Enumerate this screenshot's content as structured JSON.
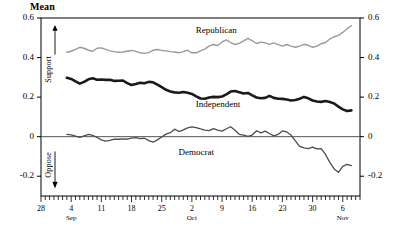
{
  "chart_data": {
    "type": "line",
    "title": "Mean",
    "xlabel": "",
    "ylabel": "Mean",
    "ylim": [
      -0.3,
      0.6
    ],
    "xlim": [
      0,
      74
    ],
    "grid": false,
    "legend_position": "inline-annotations",
    "y_ticks": [
      0.6,
      0.4,
      0.2,
      0,
      -0.2
    ],
    "y_tick_labels": [
      "0.6",
      "0.4",
      "0.2",
      "0",
      "-0.2"
    ],
    "y_tick_labels_right": [
      "0.6",
      "0.4",
      "0.2",
      "0",
      "-0.2"
    ],
    "x_ticks": [
      0,
      7,
      14,
      21,
      28,
      35,
      42,
      49,
      56,
      63,
      70
    ],
    "x_tick_labels": [
      "28",
      "4",
      "11",
      "18",
      "25",
      "2",
      "9",
      "16",
      "23",
      "30",
      "6"
    ],
    "x_tick_sublabels": [
      "",
      "Sep",
      "",
      "",
      "",
      "Oct",
      "",
      "",
      "",
      "",
      "Nov"
    ],
    "minor_ticks_per_major": 7,
    "annotations": [
      {
        "text": "Support",
        "orientation": "vertical",
        "arrow": "up"
      },
      {
        "text": "Oppose",
        "orientation": "vertical",
        "arrow": "down"
      }
    ],
    "series": [
      {
        "name": "Republican",
        "color": "#9a9a9a",
        "width": 1.4,
        "label_x": 41,
        "label_y": 0.535,
        "x": [
          6,
          7,
          8,
          9,
          10,
          11,
          12,
          13,
          14,
          15,
          16,
          17,
          18,
          19,
          20,
          21,
          22,
          23,
          24,
          25,
          26,
          27,
          28,
          29,
          30,
          31,
          32,
          33,
          34,
          35,
          36,
          37,
          38,
          39,
          40,
          41,
          42,
          43,
          44,
          45,
          46,
          47,
          48,
          49,
          50,
          51,
          52,
          53,
          54,
          55,
          56,
          57,
          58,
          59,
          60,
          61,
          62,
          63,
          64,
          65,
          66,
          67,
          68,
          69,
          70,
          71,
          72
        ],
        "values": [
          0.427,
          0.432,
          0.441,
          0.452,
          0.447,
          0.437,
          0.432,
          0.447,
          0.449,
          0.441,
          0.434,
          0.43,
          0.427,
          0.428,
          0.432,
          0.436,
          0.431,
          0.424,
          0.421,
          0.425,
          0.437,
          0.441,
          0.436,
          0.434,
          0.43,
          0.428,
          0.424,
          0.43,
          0.437,
          0.424,
          0.424,
          0.434,
          0.443,
          0.458,
          0.466,
          0.461,
          0.479,
          0.489,
          0.476,
          0.466,
          0.472,
          0.484,
          0.497,
          0.484,
          0.471,
          0.478,
          0.474,
          0.467,
          0.474,
          0.465,
          0.458,
          0.466,
          0.458,
          0.452,
          0.458,
          0.467,
          0.462,
          0.452,
          0.458,
          0.47,
          0.476,
          0.494,
          0.505,
          0.512,
          0.527,
          0.546,
          0.561
        ]
      },
      {
        "name": "Independent",
        "color": "#1a1a1a",
        "width": 2.6,
        "label_x": 41,
        "label_y": 0.158,
        "x": [
          6,
          7,
          8,
          9,
          10,
          11,
          12,
          13,
          14,
          15,
          16,
          17,
          18,
          19,
          20,
          21,
          22,
          23,
          24,
          25,
          26,
          27,
          28,
          29,
          30,
          31,
          32,
          33,
          34,
          35,
          36,
          37,
          38,
          39,
          40,
          41,
          42,
          43,
          44,
          45,
          46,
          47,
          48,
          49,
          50,
          51,
          52,
          53,
          54,
          55,
          56,
          57,
          58,
          59,
          60,
          61,
          62,
          63,
          64,
          65,
          66,
          67,
          68,
          69,
          70,
          71,
          72
        ],
        "values": [
          0.298,
          0.292,
          0.28,
          0.268,
          0.277,
          0.29,
          0.295,
          0.288,
          0.289,
          0.287,
          0.288,
          0.282,
          0.283,
          0.284,
          0.271,
          0.261,
          0.266,
          0.272,
          0.27,
          0.277,
          0.275,
          0.263,
          0.25,
          0.237,
          0.228,
          0.224,
          0.222,
          0.226,
          0.222,
          0.216,
          0.204,
          0.193,
          0.192,
          0.198,
          0.201,
          0.2,
          0.203,
          0.214,
          0.228,
          0.231,
          0.225,
          0.218,
          0.221,
          0.209,
          0.198,
          0.194,
          0.196,
          0.206,
          0.196,
          0.192,
          0.191,
          0.188,
          0.183,
          0.185,
          0.192,
          0.201,
          0.194,
          0.183,
          0.178,
          0.176,
          0.18,
          0.175,
          0.168,
          0.152,
          0.138,
          0.13,
          0.133
        ]
      },
      {
        "name": "Democrat",
        "color": "#4d4d4d",
        "width": 1.3,
        "label_x": 37,
        "label_y": -0.085,
        "x": [
          6,
          7,
          8,
          9,
          10,
          11,
          12,
          13,
          14,
          15,
          16,
          17,
          18,
          19,
          20,
          21,
          22,
          23,
          24,
          25,
          26,
          27,
          28,
          29,
          30,
          31,
          32,
          33,
          34,
          35,
          36,
          37,
          38,
          39,
          40,
          41,
          42,
          43,
          44,
          45,
          46,
          47,
          48,
          49,
          50,
          51,
          52,
          53,
          54,
          55,
          56,
          57,
          58,
          59,
          60,
          61,
          62,
          63,
          64,
          65,
          66,
          67,
          68,
          69,
          70,
          71,
          72
        ],
        "values": [
          0.012,
          0.009,
          0.003,
          -0.004,
          0.004,
          0.012,
          0.007,
          -0.004,
          -0.016,
          -0.022,
          -0.019,
          -0.013,
          -0.013,
          -0.011,
          -0.013,
          -0.007,
          -0.005,
          -0.01,
          -0.008,
          -0.02,
          -0.028,
          -0.016,
          -0.002,
          0.013,
          0.02,
          0.038,
          0.026,
          0.034,
          0.044,
          0.05,
          0.046,
          0.039,
          0.033,
          0.031,
          0.041,
          0.033,
          0.028,
          0.04,
          0.05,
          0.032,
          0.012,
          0.008,
          0.001,
          0.008,
          0.03,
          0.019,
          0.028,
          0.016,
          0.004,
          0.011,
          0.029,
          0.024,
          0.008,
          -0.021,
          -0.049,
          -0.057,
          -0.061,
          -0.053,
          -0.062,
          -0.06,
          -0.09,
          -0.13,
          -0.163,
          -0.18,
          -0.15,
          -0.14,
          -0.146
        ]
      }
    ]
  }
}
